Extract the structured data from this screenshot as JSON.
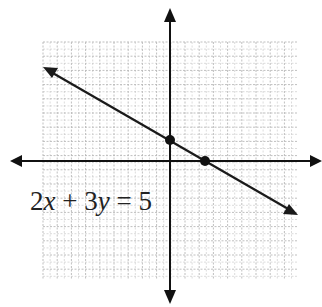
{
  "diagram": {
    "equation_label": "2x + 3y = 5",
    "equation_parts": {
      "a": "2",
      "x": "x",
      "op1": " + ",
      "b": "3",
      "y": "y",
      "op2": " = ",
      "c": "5"
    },
    "grid": {
      "left": 43,
      "top": 42,
      "right": 298,
      "bottom": 280,
      "spacing": 14.2,
      "color": "#b8b8b8"
    },
    "axes": {
      "origin_x": 170,
      "origin_y": 161,
      "color": "#111111"
    },
    "line": {
      "x1": 43,
      "y1": 67,
      "x2": 298,
      "y2": 215,
      "color": "#1a1a1a"
    },
    "points": [
      {
        "label": "y-intercept",
        "x": 170,
        "y": 140
      },
      {
        "label": "x-intercept",
        "x": 205,
        "y": 161
      }
    ]
  },
  "chart_data": {
    "type": "line",
    "title": "",
    "equation": "2x + 3y = 5",
    "intercepts": [
      {
        "x": 0,
        "y": 1.667
      },
      {
        "x": 2.5,
        "y": 0
      }
    ],
    "grid": true
  }
}
